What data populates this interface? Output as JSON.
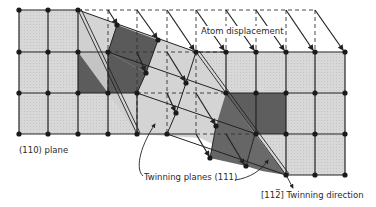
{
  "figure": {
    "labels": {
      "atom_displacement": "Atom displacement",
      "plane_110": "(110) plane",
      "twinning_planes": "Twinning planes (111)",
      "twinning_direction_index": "[11̅2]",
      "twinning_direction": "[112̅] Twinning direction"
    },
    "colors": {
      "light_cell": "#d6d6d6",
      "dark_cell": "#5c5c5c",
      "mid_cell": "#a8a8a8",
      "line": "#222222",
      "background": "#ffffff"
    },
    "grid": {
      "columns_x": [
        19,
        48,
        78,
        108,
        137,
        167,
        196,
        226,
        256,
        286,
        315,
        345
      ],
      "rows_y": [
        10,
        52,
        93,
        134,
        175
      ]
    }
  }
}
